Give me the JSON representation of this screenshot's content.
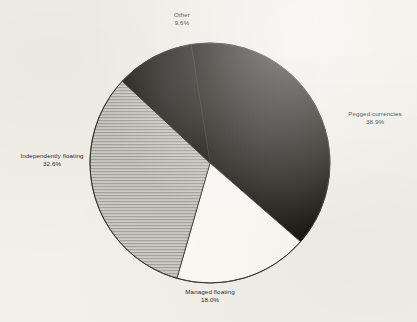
{
  "chart_data": {
    "type": "pie",
    "title": "",
    "subtitle": "",
    "legend_position": "outside-labels",
    "labels": [
      "Pegged currencies",
      "Managed floating",
      "Independently floating",
      "Other"
    ],
    "values": [
      38.9,
      18.0,
      32.6,
      9.6
    ],
    "value_suffix": "%",
    "slices": [
      {
        "name": "Pegged currencies",
        "value": 38.9,
        "value_text": "38.9%",
        "fill": "#23201c",
        "pattern": "solid",
        "start_angle": -9,
        "end_angle": 131,
        "label_anchor": "right"
      },
      {
        "name": "Managed floating",
        "value": 18.0,
        "value_text": "18.0%",
        "fill": "#fbfaf5",
        "pattern": "none",
        "start_angle": 131,
        "end_angle": 196,
        "label_anchor": "bottom"
      },
      {
        "name": "Independently floating",
        "value": 32.6,
        "value_text": "32.6%",
        "fill": "#c3c2bb",
        "pattern": "horizontal-hatch",
        "start_angle": 196,
        "end_angle": 313,
        "label_anchor": "left"
      },
      {
        "name": "Other",
        "value": 9.6,
        "value_text": "9.6%",
        "fill": "#23201c",
        "pattern": "solid",
        "start_angle": 313,
        "end_angle": 351,
        "label_anchor": "top"
      }
    ],
    "geometry": {
      "center_x": 210,
      "center_y": 163,
      "radius": 120,
      "outline_color": "#33302b"
    }
  },
  "labels": {
    "other": {
      "name": "Other",
      "value": "9.6%"
    },
    "pegged": {
      "name": "Pegged currencies",
      "value": "38.9%"
    },
    "independently": {
      "name": "Independently floating",
      "value": "32.6%"
    },
    "managed": {
      "name": "Managed floating",
      "value": "18.0%"
    }
  }
}
